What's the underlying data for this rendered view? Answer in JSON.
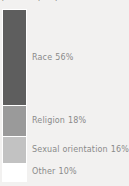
{
  "chart_data": {
    "type": "bar",
    "subtype": "stacked-single-column",
    "title": "",
    "subtitle": "(total = 1,700)",
    "xlabel": "",
    "ylabel": "",
    "grid": false,
    "legend_position": "inline-right",
    "orientation": "vertical",
    "value_unit": "%",
    "ylim": [
      0,
      100
    ],
    "categories": [
      "Race",
      "Religion",
      "Sexual orientation",
      "Other"
    ],
    "values": [
      56,
      18,
      16,
      10
    ],
    "value_labels": [
      "56%",
      "18%",
      "16%",
      "10%"
    ],
    "colors": [
      "#5e5e5e",
      "#9a9a9a",
      "#c2c2c2",
      "#ffffff"
    ],
    "segments": [
      {
        "label": "Race",
        "value": 56,
        "value_label": "56%",
        "color": "#5e5e5e"
      },
      {
        "label": "Religion",
        "value": 18,
        "value_label": "18%",
        "color": "#9a9a9a"
      },
      {
        "label": "Sexual orientation",
        "value": 16,
        "value_label": "16%",
        "color": "#c2c2c2"
      },
      {
        "label": "Other",
        "value": 10,
        "value_label": "10%",
        "color": "#ffffff"
      }
    ],
    "background_color": "#f2f1f0",
    "label_color": "#8a8a8a",
    "segment_border_color": "#ffffff"
  }
}
